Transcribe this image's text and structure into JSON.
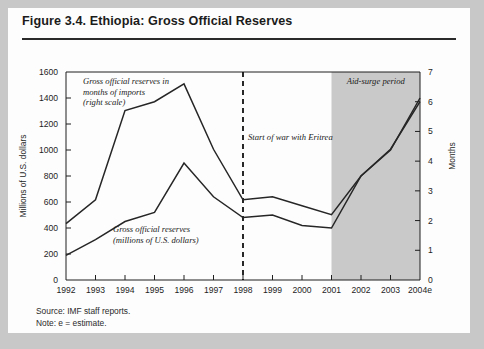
{
  "figure": {
    "title": "Figure 3.4. Ethiopia: Gross Official Reserves",
    "source_line": "Source: IMF staff reports.",
    "note_line": "Note: e = estimate."
  },
  "colors": {
    "page_background": "#c8c8c8",
    "card_background": "#fdfdfd",
    "line": "#262626",
    "shaded_band": "#c9c9c9",
    "axis": "#1e1e1e",
    "war_marker": "#111111"
  },
  "chart_data": {
    "type": "line",
    "title": "Figure 3.4. Ethiopia: Gross Official Reserves",
    "xlabel": "",
    "categories": [
      "1992",
      "1993",
      "1994",
      "1995",
      "1996",
      "1997",
      "1998",
      "1999",
      "2000",
      "2001",
      "2002",
      "2003",
      "2004e"
    ],
    "left_axis": {
      "label": "Millions of U.S. dollars",
      "ylim": [
        0,
        1600
      ],
      "ticks": [
        0,
        200,
        400,
        600,
        800,
        1000,
        1200,
        1400,
        1600
      ],
      "tick_labels": [
        "0",
        "200",
        "400",
        "600",
        "800",
        "1000",
        "1200",
        "1400",
        "1600"
      ]
    },
    "right_axis": {
      "label": "Months",
      "ylim": [
        0,
        7
      ],
      "ticks": [
        0,
        1,
        2,
        3,
        4,
        5,
        6,
        7
      ],
      "tick_labels": [
        "0",
        "1",
        "2",
        "3",
        "4",
        "5",
        "6",
        "7"
      ]
    },
    "series": [
      {
        "name": "Gross official reserves (millions of U.S. dollars)",
        "axis": "left",
        "values": [
          190,
          310,
          450,
          520,
          900,
          640,
          480,
          500,
          420,
          400,
          800,
          1000,
          1400
        ]
      },
      {
        "name": "Gross official reserves in months of imports (right scale)",
        "axis": "right",
        "values": [
          1.9,
          2.7,
          5.7,
          6.0,
          6.6,
          4.4,
          2.7,
          2.8,
          2.5,
          2.2,
          3.5,
          4.4,
          6.0
        ]
      }
    ],
    "annotations": [
      {
        "id": "months-label",
        "text_lines": [
          "Gross official reserves in",
          "months of imports",
          "(right scale)"
        ]
      },
      {
        "id": "usd-label",
        "text_lines": [
          "Gross official reserves",
          "(millions of U.S. dollars)"
        ]
      },
      {
        "id": "war-marker",
        "text": "Start of war with Eritrea",
        "at_category": "1998",
        "style": "dashed-vertical"
      },
      {
        "id": "aid-surge",
        "text": "Aid-surge period",
        "from_category": "2001",
        "to_category": "2004e",
        "style": "shaded-band"
      }
    ],
    "grid": false,
    "legend": "inline-annotations"
  }
}
